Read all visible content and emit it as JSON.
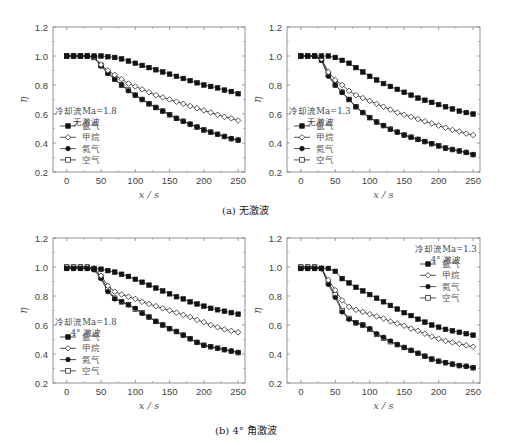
{
  "figure": {
    "captions": [
      {
        "id": "a",
        "text": "(a) 无激波",
        "x": 222,
        "y": 210
      },
      {
        "id": "b",
        "text": "(b) 4° 角激波",
        "x": 215,
        "y": 428
      }
    ],
    "series_styles": [
      {
        "name": "氩气",
        "marker": "square-filled"
      },
      {
        "name": "甲烷",
        "marker": "diamond-open"
      },
      {
        "name": "氦气",
        "marker": "circle-filled"
      },
      {
        "name": "空气",
        "marker": "square-open"
      }
    ]
  },
  "chart_data": [
    {
      "id": "a-left",
      "type": "line",
      "title": "",
      "xlabel": "x / s",
      "ylabel": "η",
      "xlim": [
        -20,
        260
      ],
      "ylim": [
        0.2,
        1.2
      ],
      "xticks": [
        0,
        50,
        100,
        150,
        200,
        250
      ],
      "yticks": [
        0.2,
        0.4,
        0.6,
        0.8,
        1.0,
        1.2
      ],
      "legend": {
        "title_lines": [
          "冷却流Ma=1.8",
          "无激波"
        ],
        "position": "lower-left",
        "entries": [
          "氩气",
          "甲烷",
          "氦气",
          "空气"
        ]
      },
      "x": [
        0,
        10,
        20,
        30,
        40,
        50,
        60,
        70,
        80,
        90,
        100,
        110,
        120,
        130,
        140,
        150,
        160,
        170,
        180,
        190,
        200,
        210,
        220,
        230,
        240,
        250
      ],
      "series": [
        {
          "name": "氩气",
          "values": [
            1.0,
            1.0,
            1.0,
            1.0,
            1.0,
            1.0,
            0.995,
            0.99,
            0.98,
            0.965,
            0.95,
            0.935,
            0.92,
            0.905,
            0.89,
            0.875,
            0.86,
            0.845,
            0.83,
            0.815,
            0.8,
            0.79,
            0.78,
            0.765,
            0.755,
            0.74
          ]
        },
        {
          "name": "甲烷",
          "values": [
            1.0,
            1.0,
            1.0,
            1.0,
            0.99,
            0.94,
            0.9,
            0.87,
            0.84,
            0.81,
            0.79,
            0.77,
            0.75,
            0.73,
            0.715,
            0.7,
            0.685,
            0.67,
            0.655,
            0.64,
            0.625,
            0.61,
            0.595,
            0.58,
            0.57,
            0.555
          ]
        },
        {
          "name": "氦气",
          "values": [
            1.0,
            1.0,
            1.0,
            1.0,
            0.99,
            0.93,
            0.88,
            0.84,
            0.8,
            0.76,
            0.73,
            0.7,
            0.67,
            0.645,
            0.62,
            0.595,
            0.57,
            0.55,
            0.53,
            0.51,
            0.49,
            0.475,
            0.46,
            0.445,
            0.43,
            0.42
          ]
        },
        {
          "name": "空气",
          "values": [
            1.0,
            1.0,
            1.0,
            1.0,
            0.99,
            0.935,
            0.885,
            0.84,
            0.8,
            0.765,
            0.73,
            0.7,
            0.67,
            0.645,
            0.62,
            0.595,
            0.57,
            0.55,
            0.53,
            0.51,
            0.49,
            0.475,
            0.46,
            0.445,
            0.43,
            0.42
          ]
        }
      ]
    },
    {
      "id": "a-right",
      "type": "line",
      "title": "",
      "xlabel": "x / s",
      "ylabel": "η",
      "xlim": [
        -20,
        260
      ],
      "ylim": [
        0.2,
        1.2
      ],
      "xticks": [
        0,
        50,
        100,
        150,
        200,
        250
      ],
      "yticks": [
        0.2,
        0.4,
        0.6,
        0.8,
        1.0,
        1.2
      ],
      "legend": {
        "title_lines": [
          "冷却流Ma=1.3",
          "无激波"
        ],
        "position": "lower-left",
        "entries": [
          "氩气",
          "甲烷",
          "氦气",
          "空气"
        ]
      },
      "x": [
        0,
        10,
        20,
        30,
        40,
        50,
        60,
        70,
        80,
        90,
        100,
        110,
        120,
        130,
        140,
        150,
        160,
        170,
        180,
        190,
        200,
        210,
        220,
        230,
        240,
        250
      ],
      "series": [
        {
          "name": "氩气",
          "values": [
            1.0,
            1.0,
            1.0,
            1.0,
            1.0,
            0.99,
            0.97,
            0.95,
            0.92,
            0.89,
            0.86,
            0.835,
            0.81,
            0.79,
            0.77,
            0.75,
            0.73,
            0.71,
            0.695,
            0.68,
            0.665,
            0.65,
            0.635,
            0.62,
            0.61,
            0.6
          ]
        },
        {
          "name": "甲烷",
          "values": [
            1.0,
            1.0,
            1.0,
            0.98,
            0.89,
            0.835,
            0.8,
            0.76,
            0.73,
            0.71,
            0.69,
            0.67,
            0.65,
            0.63,
            0.61,
            0.595,
            0.58,
            0.565,
            0.55,
            0.535,
            0.52,
            0.505,
            0.49,
            0.48,
            0.465,
            0.455
          ]
        },
        {
          "name": "氦气",
          "values": [
            1.0,
            1.0,
            1.0,
            0.97,
            0.86,
            0.8,
            0.75,
            0.7,
            0.65,
            0.61,
            0.575,
            0.545,
            0.52,
            0.495,
            0.475,
            0.455,
            0.44,
            0.425,
            0.41,
            0.395,
            0.38,
            0.365,
            0.355,
            0.345,
            0.335,
            0.32
          ]
        },
        {
          "name": "空气",
          "values": [
            1.0,
            1.0,
            1.0,
            0.97,
            0.87,
            0.8,
            0.75,
            0.7,
            0.65,
            0.61,
            0.575,
            0.545,
            0.52,
            0.495,
            0.475,
            0.455,
            0.44,
            0.425,
            0.41,
            0.395,
            0.38,
            0.365,
            0.355,
            0.345,
            0.335,
            0.32
          ]
        }
      ]
    },
    {
      "id": "b-left",
      "type": "line",
      "title": "",
      "xlabel": "x / s",
      "ylabel": "η",
      "xlim": [
        -20,
        260
      ],
      "ylim": [
        0.2,
        1.2
      ],
      "xticks": [
        0,
        50,
        100,
        150,
        200,
        250
      ],
      "yticks": [
        0.2,
        0.4,
        0.6,
        0.8,
        1.0,
        1.2
      ],
      "legend": {
        "title_lines": [
          "冷却流Ma=1.8",
          "4° 激波"
        ],
        "position": "lower-left",
        "entries": [
          "氩气",
          "甲烷",
          "氦气",
          "空气"
        ]
      },
      "x": [
        0,
        10,
        20,
        30,
        40,
        50,
        60,
        70,
        80,
        90,
        100,
        110,
        120,
        130,
        140,
        150,
        160,
        170,
        180,
        190,
        200,
        210,
        220,
        230,
        240,
        250
      ],
      "series": [
        {
          "name": "氩气",
          "values": [
            0.99,
            0.99,
            0.99,
            0.99,
            0.99,
            0.985,
            0.975,
            0.965,
            0.95,
            0.935,
            0.915,
            0.895,
            0.875,
            0.855,
            0.835,
            0.815,
            0.795,
            0.78,
            0.76,
            0.745,
            0.73,
            0.715,
            0.705,
            0.695,
            0.685,
            0.675
          ]
        },
        {
          "name": "甲烷",
          "values": [
            1.0,
            1.0,
            1.0,
            1.0,
            0.99,
            0.94,
            0.87,
            0.83,
            0.81,
            0.795,
            0.78,
            0.76,
            0.745,
            0.73,
            0.715,
            0.7,
            0.685,
            0.67,
            0.655,
            0.635,
            0.62,
            0.6,
            0.585,
            0.57,
            0.56,
            0.55
          ]
        },
        {
          "name": "氦气",
          "values": [
            0.99,
            0.99,
            0.99,
            0.99,
            0.98,
            0.92,
            0.83,
            0.78,
            0.76,
            0.74,
            0.715,
            0.68,
            0.655,
            0.625,
            0.6,
            0.575,
            0.555,
            0.53,
            0.505,
            0.48,
            0.46,
            0.45,
            0.44,
            0.43,
            0.42,
            0.41
          ]
        },
        {
          "name": "空气",
          "values": [
            1.0,
            1.0,
            1.0,
            1.0,
            0.985,
            0.93,
            0.845,
            0.785,
            0.76,
            0.74,
            0.71,
            0.685,
            0.655,
            0.625,
            0.6,
            0.575,
            0.555,
            0.53,
            0.505,
            0.48,
            0.46,
            0.45,
            0.44,
            0.43,
            0.42,
            0.41
          ]
        }
      ]
    },
    {
      "id": "b-right",
      "type": "line",
      "title": "",
      "xlabel": "x / s",
      "ylabel": "η",
      "xlim": [
        -20,
        260
      ],
      "ylim": [
        0.2,
        1.2
      ],
      "xticks": [
        0,
        50,
        100,
        150,
        200,
        250
      ],
      "yticks": [
        0.2,
        0.4,
        0.6,
        0.8,
        1.0,
        1.2
      ],
      "legend": {
        "title_lines": [
          "冷却流Ma=1.3",
          "4° 激波"
        ],
        "position": "upper-right",
        "entries": [
          "氩气",
          "甲烷",
          "氦气",
          "空气"
        ]
      },
      "x": [
        0,
        10,
        20,
        30,
        40,
        50,
        60,
        70,
        80,
        90,
        100,
        110,
        120,
        130,
        140,
        150,
        160,
        170,
        180,
        190,
        200,
        210,
        220,
        230,
        240,
        250
      ],
      "series": [
        {
          "name": "氩气",
          "values": [
            0.99,
            0.99,
            0.99,
            0.99,
            0.99,
            0.97,
            0.92,
            0.89,
            0.86,
            0.835,
            0.81,
            0.785,
            0.76,
            0.735,
            0.71,
            0.685,
            0.665,
            0.64,
            0.62,
            0.6,
            0.585,
            0.57,
            0.56,
            0.55,
            0.54,
            0.53
          ]
        },
        {
          "name": "甲烷",
          "values": [
            1.0,
            1.0,
            1.0,
            0.99,
            0.91,
            0.84,
            0.77,
            0.725,
            0.705,
            0.69,
            0.675,
            0.66,
            0.645,
            0.625,
            0.61,
            0.595,
            0.575,
            0.56,
            0.54,
            0.52,
            0.505,
            0.49,
            0.48,
            0.47,
            0.46,
            0.45
          ]
        },
        {
          "name": "氦气",
          "values": [
            0.99,
            0.99,
            0.99,
            0.99,
            0.88,
            0.79,
            0.69,
            0.64,
            0.615,
            0.6,
            0.575,
            0.54,
            0.515,
            0.49,
            0.465,
            0.445,
            0.425,
            0.405,
            0.385,
            0.365,
            0.35,
            0.34,
            0.33,
            0.32,
            0.315,
            0.305
          ]
        },
        {
          "name": "空气",
          "values": [
            1.0,
            1.0,
            1.0,
            0.99,
            0.89,
            0.81,
            0.7,
            0.645,
            0.615,
            0.6,
            0.57,
            0.535,
            0.51,
            0.485,
            0.465,
            0.445,
            0.425,
            0.405,
            0.385,
            0.365,
            0.35,
            0.34,
            0.33,
            0.32,
            0.315,
            0.305
          ]
        }
      ]
    }
  ]
}
